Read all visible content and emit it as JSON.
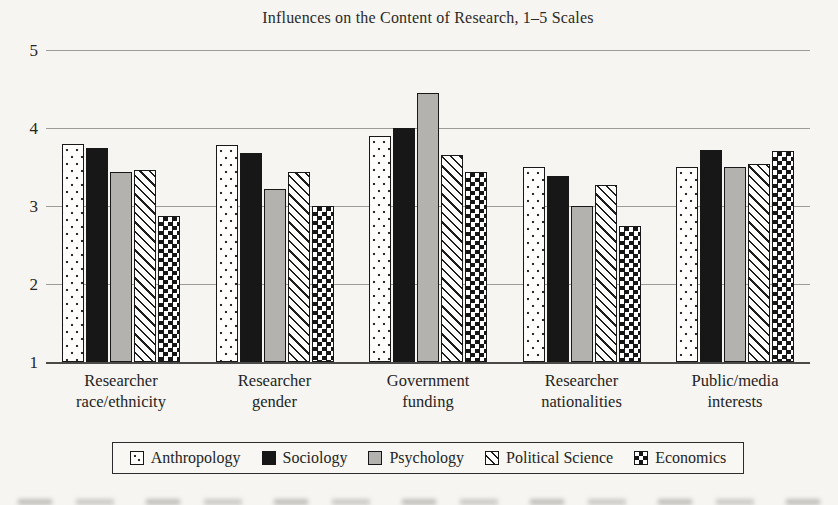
{
  "chart_data": {
    "type": "bar",
    "title": "Influences on the Content of Research, 1–5 Scales",
    "categories": [
      "Researcher race/ethnicity",
      "Researcher gender",
      "Government funding",
      "Researcher nationalities",
      "Public/media interests"
    ],
    "series": [
      {
        "name": "Anthropology",
        "pattern": "dots",
        "values": [
          3.8,
          3.78,
          3.9,
          3.5,
          3.5
        ]
      },
      {
        "name": "Sociology",
        "pattern": "solid-black",
        "values": [
          3.74,
          3.68,
          4.0,
          3.38,
          3.72
        ]
      },
      {
        "name": "Psychology",
        "pattern": "solid-gray",
        "values": [
          3.43,
          3.22,
          4.45,
          3.0,
          3.5
        ]
      },
      {
        "name": "Political Science",
        "pattern": "diagonal-stripes",
        "values": [
          3.46,
          3.43,
          3.65,
          3.27,
          3.54
        ]
      },
      {
        "name": "Economics",
        "pattern": "checkerboard",
        "values": [
          2.87,
          3.0,
          3.43,
          2.75,
          3.7
        ]
      }
    ],
    "xlabel": "",
    "ylabel": "",
    "ylim": [
      1,
      5
    ],
    "yticks": [
      1,
      2,
      3,
      4,
      5
    ],
    "grid": true,
    "legend_position": "bottom"
  },
  "colors": {
    "paper": "#f6f5f1",
    "ink": "#181818",
    "gray_bar": "#b3b2af",
    "gridline": "#9d9c99",
    "baseline": "#4b4a48"
  }
}
